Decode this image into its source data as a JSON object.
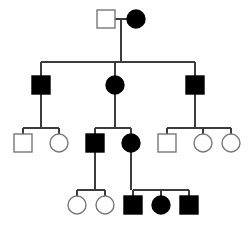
{
  "diagram": {
    "kind": "pedigree-chart",
    "title": "",
    "colors": {
      "affected_fill": "#000000",
      "unaffected_fill": "#ffffff",
      "symbol_stroke": "#777777",
      "affected_stroke": "#000000",
      "line_stroke": "#3c3c3c",
      "background": "#ffffff"
    },
    "symbol_size": 18,
    "legend": {
      "square_meaning": "male",
      "circle_meaning": "female",
      "filled_meaning": "affected",
      "open_meaning": "unaffected"
    },
    "generations": [
      {
        "id": "I",
        "label": "",
        "y": 10,
        "individuals": [
          {
            "id": "I-1",
            "name": "gen1-male-unaffected",
            "shape": "square",
            "status": "unaffected",
            "x": 97,
            "y": 10
          },
          {
            "id": "I-2",
            "name": "gen1-female-affected",
            "shape": "circle",
            "status": "affected",
            "x": 127,
            "y": 10
          }
        ]
      },
      {
        "id": "II",
        "label": "",
        "y": 76,
        "individuals": [
          {
            "id": "II-1",
            "name": "gen2-male-affected-left",
            "shape": "square",
            "status": "affected",
            "x": 32,
            "y": 76
          },
          {
            "id": "II-2",
            "name": "gen2-female-affected-middle",
            "shape": "circle",
            "status": "affected",
            "x": 106,
            "y": 76
          },
          {
            "id": "II-3",
            "name": "gen2-male-affected-right",
            "shape": "square",
            "status": "affected",
            "x": 186,
            "y": 76
          }
        ]
      },
      {
        "id": "III",
        "label": "",
        "y": 134,
        "individuals": [
          {
            "id": "III-1",
            "name": "gen3-male-unaffected-a",
            "shape": "square",
            "status": "unaffected",
            "x": 14,
            "y": 134
          },
          {
            "id": "III-2",
            "name": "gen3-female-unaffected-a",
            "shape": "circle",
            "status": "unaffected",
            "x": 50,
            "y": 134
          },
          {
            "id": "III-3",
            "name": "gen3-male-affected",
            "shape": "square",
            "status": "affected",
            "x": 86,
            "y": 134
          },
          {
            "id": "III-4",
            "name": "gen3-female-affected",
            "shape": "circle",
            "status": "affected",
            "x": 122,
            "y": 134
          },
          {
            "id": "III-5",
            "name": "gen3-male-unaffected-b",
            "shape": "square",
            "status": "unaffected",
            "x": 158,
            "y": 134
          },
          {
            "id": "III-6",
            "name": "gen3-female-unaffected-b",
            "shape": "circle",
            "status": "unaffected",
            "x": 194,
            "y": 134
          },
          {
            "id": "III-7",
            "name": "gen3-female-unaffected-c",
            "shape": "circle",
            "status": "unaffected",
            "x": 222,
            "y": 134
          }
        ]
      },
      {
        "id": "IV",
        "label": "",
        "y": 196,
        "individuals": [
          {
            "id": "IV-1",
            "name": "gen4-female-unaffected-a",
            "shape": "circle",
            "status": "unaffected",
            "x": 68,
            "y": 196
          },
          {
            "id": "IV-2",
            "name": "gen4-female-unaffected-b",
            "shape": "circle",
            "status": "unaffected",
            "x": 96,
            "y": 196
          },
          {
            "id": "IV-3",
            "name": "gen4-male-affected-a",
            "shape": "square",
            "status": "affected",
            "x": 124,
            "y": 196
          },
          {
            "id": "IV-4",
            "name": "gen4-female-affected",
            "shape": "circle",
            "status": "affected",
            "x": 152,
            "y": 196
          },
          {
            "id": "IV-5",
            "name": "gen4-male-affected-b",
            "shape": "square",
            "status": "affected",
            "x": 180,
            "y": 196
          }
        ]
      }
    ],
    "matings": [
      {
        "id": "M1",
        "name": "mating-gen1",
        "partners": [
          "I-1",
          "I-2"
        ],
        "line_y": 19,
        "x1": 115,
        "x2": 127,
        "drop_x": 121,
        "drop_to": 62
      },
      {
        "id": "M2",
        "name": "mating-gen3-middle",
        "partners": [
          "III-3",
          "III-4"
        ],
        "line_y": 143,
        "x1": 104,
        "x2": 122,
        "drop_x": 113,
        "drop_to": 190
      }
    ],
    "sibships": [
      {
        "id": "S1",
        "name": "sibship-gen2",
        "parents": "M1",
        "bar_y": 62,
        "x_from": 41,
        "x_to": 195,
        "children_x": [
          41,
          115,
          195
        ],
        "children_top": 76
      },
      {
        "id": "S2",
        "name": "sibship-gen3-left",
        "parent": "II-1",
        "bar_y": 128,
        "x_from": 23,
        "x_to": 59,
        "children_x": [
          23,
          59
        ],
        "children_top": 134,
        "parent_drop_x": 41
      },
      {
        "id": "S3",
        "name": "sibship-gen3-middle",
        "parent": "II-2",
        "bar_y": 128,
        "x_from": 95,
        "x_to": 131,
        "children_x": [
          95,
          131
        ],
        "children_top": 134,
        "parent_drop_x": 115
      },
      {
        "id": "S4",
        "name": "sibship-gen3-right",
        "parent": "II-3",
        "bar_y": 128,
        "x_from": 167,
        "x_to": 231,
        "children_x": [
          167,
          203,
          231
        ],
        "children_top": 134,
        "parent_drop_x": 195
      },
      {
        "id": "S5",
        "name": "sibship-gen4-left",
        "parent": "III-3",
        "bar_y": 190,
        "x_from": 77,
        "x_to": 105,
        "children_x": [
          77,
          105
        ],
        "children_top": 196,
        "parent_drop_x": 95
      },
      {
        "id": "S6",
        "name": "sibship-gen4-right",
        "parent": "III-4",
        "bar_y": 190,
        "x_from": 133,
        "x_to": 189,
        "children_x": [
          133,
          161,
          189
        ],
        "children_top": 196,
        "parent_drop_x": 131
      }
    ],
    "descent_lines": [
      {
        "name": "descent-gen1-to-sibship",
        "x1": 121,
        "y1": 19,
        "x2": 121,
        "y2": 62
      },
      {
        "name": "descent-gen2-left",
        "x1": 41,
        "y1": 62,
        "x2": 41,
        "y2": 76
      },
      {
        "name": "descent-gen2-middle",
        "x1": 115,
        "y1": 62,
        "x2": 115,
        "y2": 76
      },
      {
        "name": "descent-gen2-right",
        "x1": 195,
        "y1": 62,
        "x2": 195,
        "y2": 76
      },
      {
        "name": "descent-II1-down",
        "x1": 41,
        "y1": 94,
        "x2": 41,
        "y2": 128
      },
      {
        "name": "descent-II2-down",
        "x1": 115,
        "y1": 94,
        "x2": 115,
        "y2": 128
      },
      {
        "name": "descent-II3-down",
        "x1": 195,
        "y1": 94,
        "x2": 195,
        "y2": 128
      },
      {
        "name": "descent-III1-up",
        "x1": 23,
        "y1": 128,
        "x2": 23,
        "y2": 134
      },
      {
        "name": "descent-III2-up",
        "x1": 59,
        "y1": 128,
        "x2": 59,
        "y2": 134
      },
      {
        "name": "descent-III3-up",
        "x1": 95,
        "y1": 128,
        "x2": 95,
        "y2": 134
      },
      {
        "name": "descent-III4-up",
        "x1": 131,
        "y1": 128,
        "x2": 131,
        "y2": 134
      },
      {
        "name": "descent-III5-up",
        "x1": 167,
        "y1": 128,
        "x2": 167,
        "y2": 134
      },
      {
        "name": "descent-III6-up",
        "x1": 203,
        "y1": 128,
        "x2": 203,
        "y2": 134
      },
      {
        "name": "descent-III7-up",
        "x1": 231,
        "y1": 128,
        "x2": 231,
        "y2": 134
      },
      {
        "name": "descent-III3-down",
        "x1": 95,
        "y1": 152,
        "x2": 95,
        "y2": 190
      },
      {
        "name": "descent-III4-down",
        "x1": 131,
        "y1": 152,
        "x2": 131,
        "y2": 190
      },
      {
        "name": "descent-IV1-up",
        "x1": 77,
        "y1": 190,
        "x2": 77,
        "y2": 196
      },
      {
        "name": "descent-IV2-up",
        "x1": 105,
        "y1": 190,
        "x2": 105,
        "y2": 196
      },
      {
        "name": "descent-IV3-up",
        "x1": 133,
        "y1": 190,
        "x2": 133,
        "y2": 196
      },
      {
        "name": "descent-IV4-up",
        "x1": 161,
        "y1": 190,
        "x2": 161,
        "y2": 196
      },
      {
        "name": "descent-IV5-up",
        "x1": 189,
        "y1": 190,
        "x2": 189,
        "y2": 196
      }
    ],
    "horizontal_bars": [
      {
        "name": "mating-bar-gen1",
        "x1": 115,
        "x2": 128,
        "y": 19
      },
      {
        "name": "sibship-bar-gen2",
        "x1": 41,
        "x2": 195,
        "y": 62
      },
      {
        "name": "sibship-bar-gen3-left",
        "x1": 23,
        "x2": 59,
        "y": 128
      },
      {
        "name": "sibship-bar-gen3-middle",
        "x1": 95,
        "x2": 131,
        "y": 128
      },
      {
        "name": "sibship-bar-gen3-right",
        "x1": 167,
        "x2": 231,
        "y": 128
      },
      {
        "name": "sibship-bar-gen4-left",
        "x1": 77,
        "x2": 105,
        "y": 190
      },
      {
        "name": "sibship-bar-gen4-right",
        "x1": 133,
        "x2": 189,
        "y": 190
      }
    ]
  }
}
